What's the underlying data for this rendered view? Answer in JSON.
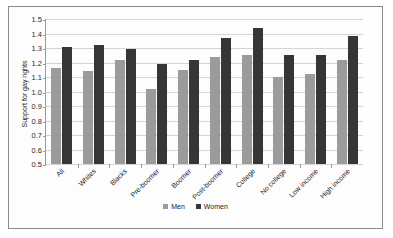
{
  "chart_data": {
    "type": "bar",
    "title": "",
    "xlabel": "",
    "ylabel": "Support for gay rights",
    "ylim": [
      0.5,
      1.5
    ],
    "yticks": [
      "0.5",
      "0.6",
      "0.7",
      "0.8",
      "0.9",
      "1.0",
      "1.1",
      "1.2",
      "1.3",
      "1.4",
      "1.5"
    ],
    "grid": true,
    "legend_position": "bottom",
    "categories": [
      "All",
      "Whites",
      "Blacks",
      "Pre-boomer",
      "Boomer",
      "Post-boomer",
      "College",
      "No college",
      "Low income",
      "High income"
    ],
    "series": [
      {
        "name": "Men",
        "color": "#9b9b9b",
        "values": [
          1.16,
          1.14,
          1.22,
          1.02,
          1.15,
          1.24,
          1.25,
          1.1,
          1.12,
          1.22
        ]
      },
      {
        "name": "Women",
        "color": "#363636",
        "values": [
          1.31,
          1.32,
          1.29,
          1.19,
          1.22,
          1.37,
          1.44,
          1.25,
          1.25,
          1.38
        ]
      }
    ]
  }
}
